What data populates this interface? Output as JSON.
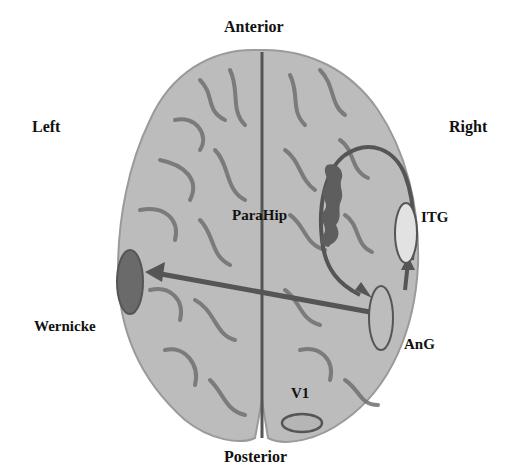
{
  "labels": {
    "anterior": "Anterior",
    "posterior": "Posterior",
    "left": "Left",
    "right": "Right",
    "parahip": "ParaHip",
    "itg": "ITG",
    "wernicke": "Wernicke",
    "ang": "AnG",
    "v1": "V1"
  },
  "colors": {
    "brain_fill": "#b8b8b8",
    "sulci": "#6e6e6e",
    "pathway": "#555555",
    "wernicke_fill": "#6a6a6a",
    "itg_fill": "#e2e2e2",
    "ang_fill": "#bdbdbd",
    "parahip_fill": "#5e5e5e"
  }
}
